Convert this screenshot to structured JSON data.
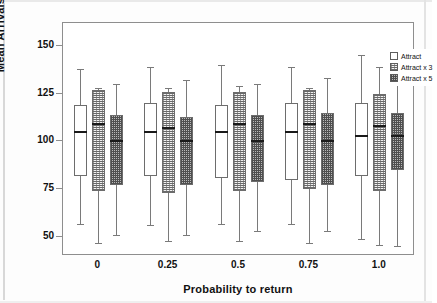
{
  "chart_data": {
    "type": "box",
    "title": "",
    "xlabel": "Probability to return",
    "ylabel": "Mean Arrivals",
    "categories": [
      "0",
      "0.25",
      "0.5",
      "0.75",
      "1.0"
    ],
    "ylim": [
      40,
      162
    ],
    "yticks": [
      50,
      75,
      100,
      125,
      150
    ],
    "ytick_labels": [
      "50",
      "75",
      "100",
      "125",
      "150"
    ],
    "grid": false,
    "legend_position": "top-right",
    "series": [
      {
        "name": "Attract",
        "fill": "plain",
        "boxes": [
          {
            "category": "0",
            "whisker_low": 57,
            "q1": 82,
            "median": 105,
            "q3": 119,
            "whisker_high": 138
          },
          {
            "category": "0.25",
            "whisker_low": 56,
            "q1": 82,
            "median": 105,
            "q3": 120,
            "whisker_high": 139
          },
          {
            "category": "0.5",
            "whisker_low": 57,
            "q1": 81,
            "median": 105,
            "q3": 119,
            "whisker_high": 140
          },
          {
            "category": "0.75",
            "whisker_low": 57,
            "q1": 80,
            "median": 105,
            "q3": 120,
            "whisker_high": 139
          },
          {
            "category": "1.0",
            "whisker_low": 49,
            "q1": 82,
            "median": 103,
            "q3": 120,
            "whisker_high": 145
          }
        ]
      },
      {
        "name": "Attract x 3",
        "fill": "dotted",
        "boxes": [
          {
            "category": "0",
            "whisker_low": 47,
            "q1": 74,
            "median": 109,
            "q3": 127,
            "whisker_high": 128
          },
          {
            "category": "0.25",
            "whisker_low": 48,
            "q1": 73,
            "median": 107,
            "q3": 126,
            "whisker_high": 128
          },
          {
            "category": "0.5",
            "whisker_low": 48,
            "q1": 74,
            "median": 109,
            "q3": 126,
            "whisker_high": 129
          },
          {
            "category": "0.75",
            "whisker_low": 47,
            "q1": 75,
            "median": 109,
            "q3": 127,
            "whisker_high": 128
          },
          {
            "category": "1.0",
            "whisker_low": 46,
            "q1": 74,
            "median": 108,
            "q3": 125,
            "whisker_high": 139
          }
        ]
      },
      {
        "name": "Attract x 5",
        "fill": "checker",
        "boxes": [
          {
            "category": "0",
            "whisker_low": 51,
            "q1": 77,
            "median": 100,
            "q3": 114,
            "whisker_high": 130
          },
          {
            "category": "0.25",
            "whisker_low": 51,
            "q1": 77,
            "median": 100,
            "q3": 113,
            "whisker_high": 132
          },
          {
            "category": "0.5",
            "whisker_low": 53,
            "q1": 79,
            "median": 100,
            "q3": 114,
            "whisker_high": 130
          },
          {
            "category": "0.75",
            "whisker_low": 53,
            "q1": 77,
            "median": 100,
            "q3": 115,
            "whisker_high": 133
          },
          {
            "category": "1.0",
            "whisker_low": 45,
            "q1": 85,
            "median": 103,
            "q3": 115,
            "whisker_high": 134
          }
        ]
      }
    ]
  },
  "legend": {
    "items": [
      {
        "label": "Attract",
        "fill": "plain"
      },
      {
        "label": "Attract x 3",
        "fill": "dotted"
      },
      {
        "label": "Attract x 5",
        "fill": "checker"
      }
    ]
  }
}
